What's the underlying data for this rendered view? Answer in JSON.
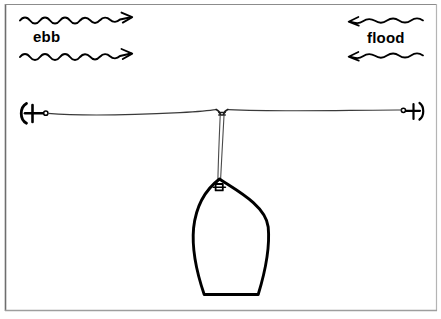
{
  "figure": {
    "background_color": "#ffffff",
    "ink_color": "#000000",
    "frame": {
      "border_color_dark": "#6e6e6e",
      "border_color_light": "#c8c8c8",
      "left": 5,
      "top": 4,
      "right": 437,
      "bottom": 311
    }
  },
  "labels": {
    "ebb": "ebb",
    "flood": "flood"
  },
  "flow_arrows": [
    {
      "name": "ebb-arrow-upper",
      "direction": "right",
      "label_group": "ebb",
      "x_start": 20,
      "x_end": 131,
      "y": 19,
      "amplitude": 2.6,
      "wavelength": 13
    },
    {
      "name": "ebb-arrow-lower",
      "direction": "right",
      "label_group": "ebb",
      "x_start": 20,
      "x_end": 131,
      "y": 55,
      "amplitude": 2.6,
      "wavelength": 13
    },
    {
      "name": "flood-arrow-upper",
      "direction": "left",
      "label_group": "flood",
      "x_start": 350,
      "x_end": 423,
      "y": 22,
      "amplitude": 2.2,
      "wavelength": 14
    },
    {
      "name": "flood-arrow-lower",
      "direction": "left",
      "label_group": "flood",
      "x_start": 350,
      "x_end": 423,
      "y": 57,
      "amplitude": 2.2,
      "wavelength": 14
    }
  ],
  "mooring": {
    "left_anchor": {
      "name": "left-anchor",
      "x": 28,
      "y": 113,
      "ring_x": 46,
      "orientation": "flukes-left"
    },
    "right_anchor": {
      "name": "right-anchor",
      "x": 411,
      "y": 111,
      "ring_x": 403,
      "orientation": "flukes-right"
    },
    "line_left_segment": {
      "from_x": 46,
      "from_y": 113,
      "to_x": 216,
      "to_y": 110
    },
    "line_right_segment": {
      "from_x": 228,
      "from_y": 110,
      "to_x": 403,
      "to_y": 109
    },
    "junction": {
      "name": "mooring-junction",
      "x": 222,
      "y": 111
    },
    "pendant": {
      "from_x": 222,
      "from_y": 113,
      "to_x": 219,
      "to_y": 183,
      "strands": 2
    }
  },
  "boat": {
    "name": "moored-boat",
    "view": "plan",
    "bow_x": 219,
    "bow_y": 178,
    "stern_y": 295,
    "port_x": 193,
    "starboard_x": 269,
    "transom_left_x": 204,
    "transom_right_x": 258,
    "bow_fitting": {
      "name": "bow-cleat",
      "x": 219,
      "y": 187
    }
  }
}
